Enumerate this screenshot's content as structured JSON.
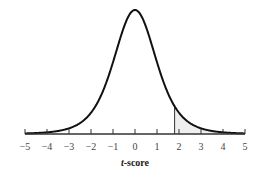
{
  "chart_data": {
    "type": "line",
    "title": "",
    "xlabel_italic": "t",
    "xlabel_rest": "-score",
    "xlabel": "t-score",
    "ylabel": "",
    "xlim": [
      -5,
      5
    ],
    "x_ticks": [
      -5,
      -4,
      -3,
      -2,
      -1,
      0,
      1,
      2,
      3,
      4,
      5
    ],
    "x_tick_labels": [
      "−5",
      "−4",
      "−3",
      "−2",
      "−1",
      "0",
      "1",
      "2",
      "3",
      "4",
      "5"
    ],
    "grid": false,
    "legend": null,
    "series": [
      {
        "name": "t-distribution density",
        "peak_x": 0,
        "shape": "bell"
      }
    ],
    "shaded_region": {
      "from": 1.8,
      "to": 5,
      "fill": "#eeeeee",
      "boundary_line_at": 1.8
    }
  },
  "colors": {
    "curve": "#111111",
    "axis": "#333333",
    "shade": "#eeeeee"
  }
}
